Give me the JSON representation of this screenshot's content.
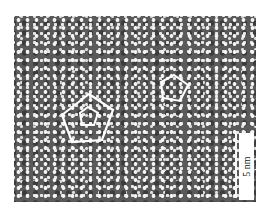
{
  "figure": {
    "type": "high-resolution electron micrograph",
    "background_color": "#5a5a5a",
    "dot_color": "#f4f4f4",
    "overlay_color": "#ffffff",
    "overlays": [
      {
        "shape": "pentagon",
        "label": "large-pentagon",
        "center": [
          82,
          101
        ],
        "radius": 24
      },
      {
        "shape": "pentagon",
        "label": "small-inner-pentagon",
        "center": [
          82,
          101
        ],
        "radius": 9
      },
      {
        "shape": "pentagon",
        "label": "right-pentagon",
        "center": [
          158,
          75
        ],
        "radius": 15
      }
    ],
    "scale_bar": {
      "label": "5 nm",
      "orientation": "vertical"
    }
  }
}
